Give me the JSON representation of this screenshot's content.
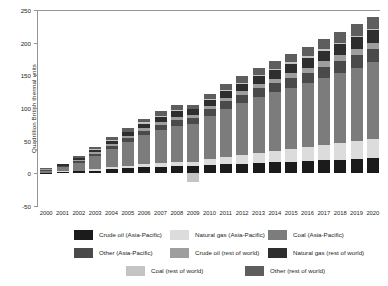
{
  "chart_data": {
    "type": "bar",
    "stacked": true,
    "title": "",
    "xlabel": "",
    "ylabel": "Quadrillion British thermal units",
    "ylim": [
      -50,
      250
    ],
    "yticks": [
      -50,
      0,
      50,
      100,
      150,
      200,
      250
    ],
    "grid": false,
    "legend_position": "bottom",
    "categories": [
      "2000",
      "2001",
      "2002",
      "2003",
      "2004",
      "2005",
      "2006",
      "2007",
      "2008",
      "2009",
      "2010",
      "2011",
      "2012",
      "2013",
      "2014",
      "2015",
      "2016",
      "2017",
      "2018",
      "2019",
      "2020"
    ],
    "series": [
      {
        "name": "Crude oil (Asia-Pacific)",
        "color": "#1b1b1b",
        "values": [
          1,
          2,
          3,
          4,
          6,
          8,
          9,
          10,
          11,
          11,
          13,
          14,
          15,
          16,
          17,
          18,
          19,
          20,
          21,
          22,
          23
        ]
      },
      {
        "name": "Natural gas (Asia-Pacific)",
        "color": "#dcdcdc",
        "values": [
          0,
          1,
          1,
          2,
          3,
          4,
          5,
          6,
          7,
          7,
          9,
          11,
          13,
          15,
          17,
          19,
          21,
          23,
          25,
          27,
          29
        ]
      },
      {
        "name": "Coal (Asia-Pacific)",
        "color": "#7c7c7c",
        "values": [
          3,
          6,
          12,
          20,
          28,
          36,
          44,
          50,
          55,
          58,
          66,
          74,
          80,
          86,
          90,
          94,
          98,
          103,
          108,
          113,
          118
        ]
      },
      {
        "name": "Other (Asia-Pacific)",
        "color": "#4a4a4a",
        "values": [
          1,
          2,
          3,
          4,
          5,
          6,
          7,
          8,
          9,
          9,
          10,
          11,
          12,
          13,
          14,
          15,
          16,
          17,
          18,
          19,
          20
        ]
      },
      {
        "name": "Crude oil (rest of world)",
        "color": "#9e9e9e",
        "values": [
          1,
          1,
          2,
          2,
          3,
          3,
          4,
          4,
          5,
          5,
          5,
          6,
          6,
          7,
          7,
          8,
          8,
          9,
          9,
          10,
          10
        ]
      },
      {
        "name": "Natural gas (rest of world)",
        "color": "#2e2e2e",
        "values": [
          1,
          2,
          3,
          4,
          5,
          6,
          7,
          8,
          8,
          8,
          9,
          10,
          11,
          12,
          13,
          14,
          15,
          16,
          17,
          18,
          19
        ]
      },
      {
        "name": "Coal (rest of world)",
        "color": "#c4c4c4",
        "values": [
          0,
          0,
          0,
          1,
          1,
          1,
          2,
          2,
          2,
          -14,
          2,
          2,
          2,
          2,
          2,
          2,
          2,
          2,
          2,
          2,
          2
        ]
      },
      {
        "name": "Other (rest of world)",
        "color": "#5e5e5e",
        "values": [
          1,
          1,
          2,
          3,
          4,
          5,
          6,
          7,
          7,
          7,
          8,
          9,
          10,
          11,
          12,
          13,
          14,
          15,
          16,
          17,
          18
        ]
      }
    ],
    "totals": [
      8,
      15,
      26,
      40,
      55,
      69,
      84,
      95,
      104,
      91,
      122,
      137,
      149,
      162,
      172,
      183,
      193,
      205,
      216,
      228,
      239
    ]
  },
  "legend": {
    "items": [
      {
        "label": "Crude oil (Asia-Pacific)",
        "color": "#1b1b1b"
      },
      {
        "label": "Natural gas (Asia-Pacific)",
        "color": "#dcdcdc"
      },
      {
        "label": "Coal (Asia-Pacific)",
        "color": "#7c7c7c"
      },
      {
        "label": "Other (Asia-Pacific)",
        "color": "#4a4a4a"
      },
      {
        "label": "Crude oil (rest of world)",
        "color": "#9e9e9e"
      },
      {
        "label": "Natural gas (rest of world)",
        "color": "#2e2e2e"
      },
      {
        "label": "Coal (rest of world)",
        "color": "#c4c4c4"
      },
      {
        "label": "Other (rest of world)",
        "color": "#5e5e5e"
      }
    ]
  },
  "axis": {
    "y_title": "Quadrillion British thermal units"
  }
}
